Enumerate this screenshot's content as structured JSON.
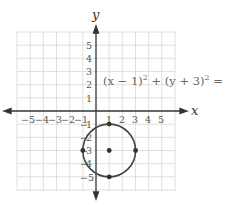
{
  "diagram": {
    "type": "coordinate-plane-circle",
    "equation": {
      "base1": "(x − 1)",
      "exp1": "2",
      "plus": " + ",
      "base2": "(y + 3)",
      "exp2": "2",
      "rhs": " = 4"
    },
    "axes": {
      "x_label": "x",
      "y_label": "y",
      "x_ticks": [
        "−5",
        "−4",
        "−3",
        "−2",
        "−1",
        "1",
        "2",
        "3",
        "4",
        "5"
      ],
      "y_ticks_positive": [
        "5",
        "4",
        "3",
        "2",
        "1"
      ],
      "y_ticks_negative": [
        "1",
        "2",
        "3",
        "4",
        "5"
      ],
      "y_tick_minus_labels": [
        "−5"
      ]
    },
    "circle": {
      "center": [
        1,
        -3
      ],
      "radius": 2,
      "marked_points": [
        [
          1,
          -3
        ],
        [
          1,
          -1
        ],
        [
          1,
          -5
        ],
        [
          -1,
          -3
        ],
        [
          3,
          -3
        ]
      ]
    },
    "colors": {
      "grid": "#d8d8d8",
      "axis": "#333333",
      "circle": "#444444",
      "text": "#555555"
    }
  }
}
